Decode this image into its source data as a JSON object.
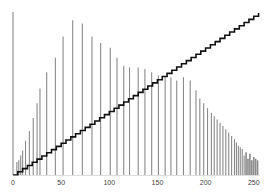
{
  "chart_data": {
    "type": "bar",
    "title": "",
    "xlabel": "",
    "ylabel": "",
    "xlim": [
      0,
      255
    ],
    "ylim": [
      0,
      1
    ],
    "grid": false,
    "legend": null,
    "x_ticks": [
      "0",
      "50",
      "100",
      "150",
      "200",
      "250"
    ],
    "x_tick_values": [
      0,
      50,
      100,
      150,
      200,
      250
    ],
    "series": [
      {
        "name": "histogram",
        "kind": "bar",
        "color": "#8a8a8a",
        "x": [
          0,
          4,
          6,
          8,
          10,
          13,
          17,
          21,
          25,
          28,
          35,
          44,
          52,
          62,
          72,
          82,
          91,
          101,
          108,
          115,
          121,
          130,
          137,
          144,
          151,
          158,
          164,
          170,
          177,
          184,
          190,
          194,
          198,
          202,
          206,
          209,
          212,
          215,
          218,
          221,
          224,
          227,
          230,
          232,
          234,
          236,
          238,
          240,
          242,
          244,
          246,
          248,
          250,
          252,
          254
        ],
        "values": [
          1.0,
          0.08,
          0.09,
          0.12,
          0.15,
          0.21,
          0.27,
          0.35,
          0.44,
          0.53,
          0.63,
          0.72,
          0.85,
          0.95,
          0.93,
          0.85,
          0.81,
          0.78,
          0.72,
          0.67,
          0.66,
          0.66,
          0.65,
          0.63,
          0.61,
          0.6,
          0.6,
          0.58,
          0.6,
          0.58,
          0.52,
          0.47,
          0.44,
          0.41,
          0.38,
          0.36,
          0.34,
          0.32,
          0.3,
          0.28,
          0.26,
          0.24,
          0.22,
          0.2,
          0.18,
          0.17,
          0.16,
          0.12,
          0.14,
          0.1,
          0.13,
          0.09,
          0.11,
          0.1,
          0.09
        ]
      },
      {
        "name": "cumulative",
        "kind": "step-line",
        "color": "#111111",
        "x_start": 0,
        "x_end": 255,
        "y_start": 0,
        "y_end": 1.0
      }
    ]
  }
}
